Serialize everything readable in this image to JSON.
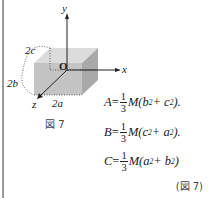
{
  "figure": {
    "axis_labels": {
      "y": "y",
      "x": "x",
      "z": "z",
      "origin": "O"
    },
    "dimension_labels": {
      "c": "2c",
      "b": "2b",
      "a": "2a"
    },
    "caption": "図 7"
  },
  "equations": [
    {
      "lhs": "A",
      "num": "1",
      "den": "3",
      "rhs_pre": "M(b",
      "rhs_mid": " + c",
      "rhs_post": ")."
    },
    {
      "lhs": "B",
      "num": "1",
      "den": "3",
      "rhs_pre": "M(c",
      "rhs_mid": " + a",
      "rhs_post": ")."
    },
    {
      "lhs": "C",
      "num": "1",
      "den": "3",
      "rhs_pre": "M(a",
      "rhs_mid": " + b",
      "rhs_post": ")"
    }
  ],
  "exponent": "2",
  "equals": " = ",
  "reference": "(図 7)"
}
